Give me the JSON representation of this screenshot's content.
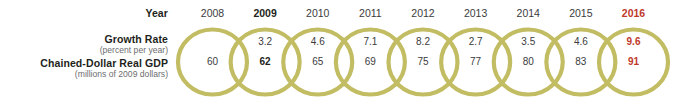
{
  "figure": {
    "row_labels": {
      "year": "Year",
      "growth_rate": "Growth Rate",
      "growth_rate_sub": "(percent per year)",
      "gdp": "Chained-Dollar Real GDP",
      "gdp_sub": "(millions of 2009 dollars)"
    },
    "colors": {
      "ring": "#c2bd64",
      "accent": "#c0392b",
      "text": "#3b3b3d",
      "subtext": "#6d6e70",
      "background": "#ffffff"
    }
  },
  "chart_data": {
    "type": "table",
    "title": "",
    "xlabel": "Year",
    "ylabel": "",
    "categories": [
      "2008",
      "2009",
      "2010",
      "2011",
      "2012",
      "2013",
      "2014",
      "2015",
      "2016"
    ],
    "series": [
      {
        "name": "Growth Rate (percent per year)",
        "values": [
          null,
          3.2,
          4.6,
          7.1,
          8.2,
          2.7,
          3.5,
          4.6,
          9.6
        ]
      },
      {
        "name": "Chained-Dollar Real GDP (millions of 2009 dollars)",
        "values": [
          60,
          62,
          65,
          69,
          75,
          77,
          80,
          83,
          91
        ]
      }
    ],
    "years": [
      {
        "year": "2008",
        "growth": "",
        "gdp": "60",
        "emphasis": "none"
      },
      {
        "year": "2009",
        "growth": "3.2",
        "gdp": "62",
        "emphasis": "bold"
      },
      {
        "year": "2010",
        "growth": "4.6",
        "gdp": "65",
        "emphasis": "none"
      },
      {
        "year": "2011",
        "growth": "7.1",
        "gdp": "69",
        "emphasis": "none"
      },
      {
        "year": "2012",
        "growth": "8.2",
        "gdp": "75",
        "emphasis": "none"
      },
      {
        "year": "2013",
        "growth": "2.7",
        "gdp": "77",
        "emphasis": "none"
      },
      {
        "year": "2014",
        "growth": "3.5",
        "gdp": "80",
        "emphasis": "none"
      },
      {
        "year": "2015",
        "growth": "4.6",
        "gdp": "83",
        "emphasis": "none"
      },
      {
        "year": "2016",
        "growth": "9.6",
        "gdp": "91",
        "emphasis": "accent"
      }
    ],
    "growth_between": [
      "3.2",
      "4.6",
      "7.1",
      "8.2",
      "2.7",
      "3.5",
      "4.6",
      "9.6"
    ]
  }
}
